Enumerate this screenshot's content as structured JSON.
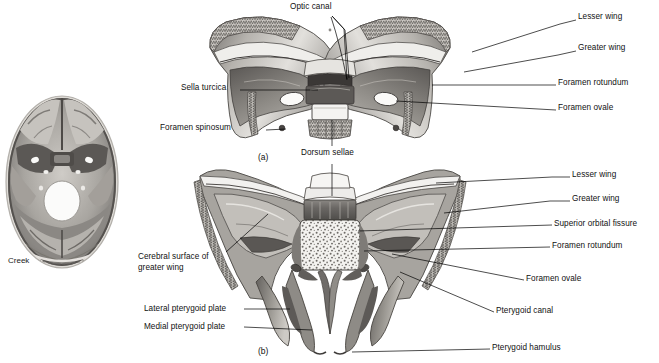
{
  "figure": {
    "kind": "anatomical-illustration",
    "signature": "Creek",
    "panels": [
      {
        "id": "(a)",
        "view": "superior view of sphenoid bone"
      },
      {
        "id": "(b)",
        "view": "posterior view of sphenoid bone"
      }
    ]
  },
  "scan": {
    "name": "axial-skull-base-image",
    "description": "grayscale axial section through skull base"
  },
  "panel_a": {
    "id": "(a)",
    "labels": {
      "optic_canal": "Optic canal",
      "lesser_wing": "Lesser wing",
      "greater_wing": "Greater wing",
      "foramen_rotundum": "Foramen rotundum",
      "foramen_ovale": "Foramen ovale",
      "sella_turcica": "Sella turcica",
      "foramen_spinosum": "Foramen spinosum",
      "dorsum_sellae": "Dorsum sellae"
    }
  },
  "panel_b": {
    "id": "(b)",
    "labels": {
      "lesser_wing": "Lesser wing",
      "greater_wing": "Greater wing",
      "superior_orbital_fissure": "Superior orbital fissure",
      "foramen_rotundum": "Foramen rotundum",
      "foramen_ovale": "Foramen ovale",
      "pterygoid_canal": "Pterygoid canal",
      "pterygoid_hamulus": "Pterygoid hamulus",
      "cerebral_surface": "Cerebral surface of greater wing",
      "lateral_pterygoid_plate": "Lateral pterygoid plate",
      "medial_pterygoid_plate": "Medial pterygoid plate"
    }
  },
  "colors": {
    "background": "#ffffff",
    "ink": "#111111",
    "bone_light": "#e8e6e2",
    "bone_mid": "#b8b5b0",
    "bone_dark": "#7d7a76",
    "bone_shadow": "#4e4c49"
  }
}
